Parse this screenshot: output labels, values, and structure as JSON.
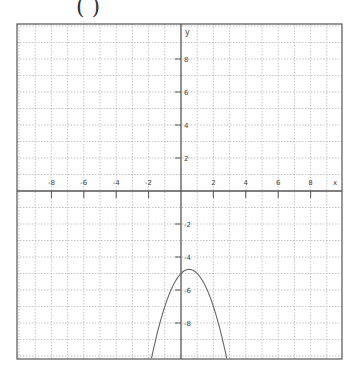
{
  "figure": {
    "label": "( )"
  },
  "chart_data": {
    "type": "line",
    "title": "",
    "xlabel": "x",
    "ylabel": "y",
    "xlim": [
      -10.2,
      10.0
    ],
    "ylim": [
      -10.3,
      10.2
    ],
    "grid": true,
    "x_ticks": [
      -8,
      -6,
      -4,
      -2,
      2,
      4,
      6,
      8
    ],
    "y_ticks": [
      8,
      6,
      4,
      2,
      -2,
      -4,
      -6,
      -8
    ],
    "x_tick_labels": [
      "-8",
      "-6",
      "-4",
      "-2",
      "2",
      "4",
      "6",
      "8"
    ],
    "y_tick_labels": [
      "8",
      "6",
      "4",
      "2",
      "-2",
      "-4",
      "-6",
      "-8"
    ],
    "series": [
      {
        "name": "y = -x^2 + x - 5",
        "function": "-x^2 + x - 5",
        "vertex": [
          0.5,
          -4.75
        ],
        "x": [
          -1.8,
          -1.5,
          -1,
          -0.5,
          0,
          0.5,
          1,
          1.5,
          2,
          2.5,
          2.7
        ],
        "y": [
          -10.04,
          -9.75,
          -7,
          -5.75,
          -5,
          -4.75,
          -5,
          -5.75,
          -7,
          -8.75,
          -9.59
        ]
      }
    ]
  },
  "plot": {
    "box": {
      "left": 17,
      "top": 24,
      "right": 342,
      "bottom": 359
    },
    "origin_px": {
      "x": 181,
      "y": 191
    },
    "unit_px": {
      "x": 16.2,
      "y": 16.5
    },
    "colors": {
      "axis": "#555555",
      "grid": "#b8b8b8",
      "curve": "#666666",
      "text": "#444444"
    }
  }
}
